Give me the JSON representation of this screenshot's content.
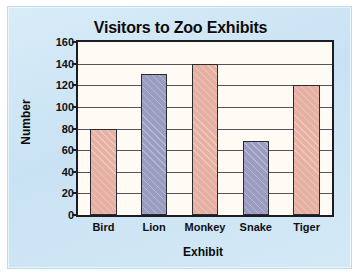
{
  "chart_data": {
    "type": "bar",
    "title": "Visitors to Zoo Exhibits",
    "xlabel": "Exhibit",
    "ylabel": "Number",
    "categories": [
      "Bird",
      "Lion",
      "Monkey",
      "Snake",
      "Tiger"
    ],
    "values": [
      80,
      130,
      140,
      68,
      120
    ],
    "bar_colors": [
      "#e6b0a2",
      "#9a9cc0",
      "#e6b0a2",
      "#9a9cc0",
      "#e6b0a2"
    ],
    "ylim": [
      0,
      160
    ],
    "yticks": [
      0,
      20,
      40,
      60,
      80,
      100,
      120,
      140,
      160
    ],
    "ytick_labels": [
      "0",
      "20",
      "40",
      "60",
      "80",
      "100",
      "120",
      "140",
      "160"
    ],
    "xtick_labels": [
      "Bird",
      "Lion",
      "Monkey",
      "Snake",
      "Tiger"
    ],
    "grid": true,
    "grid_axis": "y",
    "legend": false,
    "legend_position": "none",
    "series": [
      {
        "name": "Visitors",
        "values": [
          80,
          130,
          140,
          68,
          120
        ]
      }
    ],
    "background_color": "#cfe5f4",
    "plot_background_color": "#fdfbf4",
    "axis_color": "#1c1c22",
    "gridline_color": "#54545c",
    "text_color": "#101014"
  }
}
